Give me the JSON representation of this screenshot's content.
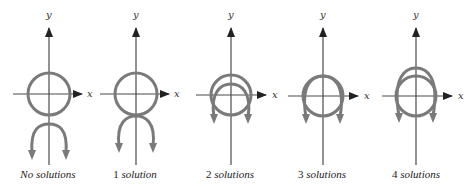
{
  "figure": {
    "axis_labels": {
      "x": "x",
      "y": "y"
    },
    "colors": {
      "curve": "#7a7a7a",
      "axis": "#4a4a4a",
      "text": "#222222"
    },
    "panels": [
      {
        "id": "no-solutions",
        "number": "No",
        "word": "solutions",
        "caption": "No solutions",
        "intersections": 0
      },
      {
        "id": "1-solution",
        "number": "1",
        "word": "solution",
        "caption": "1 solution",
        "intersections": 1
      },
      {
        "id": "2-solutions",
        "number": "2",
        "word": "solutions",
        "caption": "2 solutions",
        "intersections": 2
      },
      {
        "id": "3-solutions",
        "number": "3",
        "word": "solutions",
        "caption": "3 solutions",
        "intersections": 3
      },
      {
        "id": "4-solutions",
        "number": "4",
        "word": "solutions",
        "caption": "4 solutions",
        "intersections": 4
      }
    ]
  }
}
